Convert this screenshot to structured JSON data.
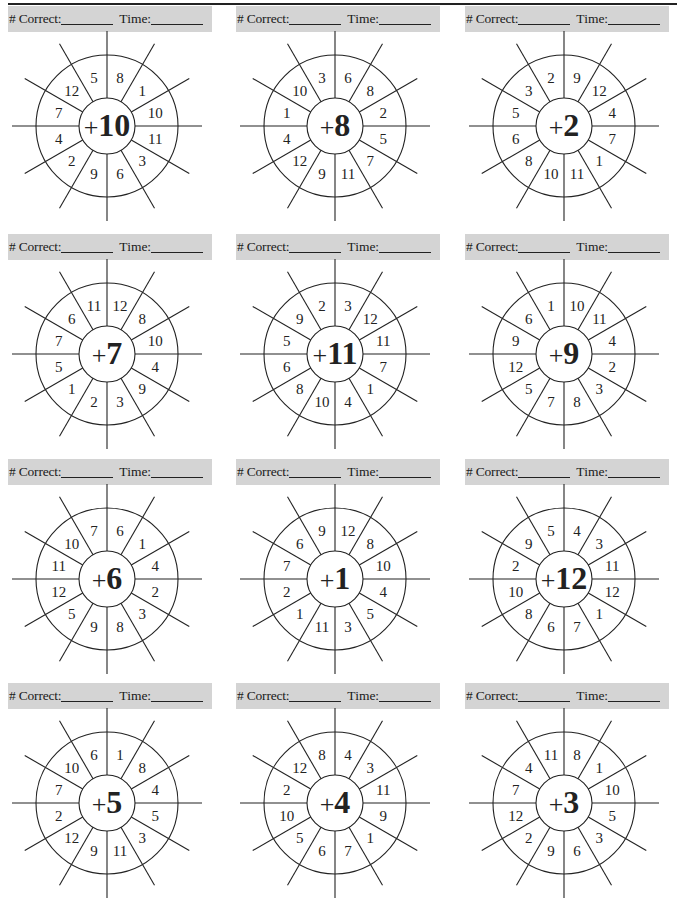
{
  "page": {
    "header_label_correct": "# Correct:",
    "header_label_time": "Time:"
  },
  "wheels": [
    {
      "operator": "+",
      "value": "10",
      "numbers": [
        "8",
        "1",
        "10",
        "11",
        "3",
        "6",
        "9",
        "2",
        "4",
        "7",
        "12",
        "5"
      ]
    },
    {
      "operator": "+",
      "value": "8",
      "numbers": [
        "6",
        "8",
        "2",
        "5",
        "7",
        "11",
        "9",
        "12",
        "4",
        "1",
        "10",
        "3"
      ]
    },
    {
      "operator": "+",
      "value": "2",
      "numbers": [
        "9",
        "12",
        "4",
        "7",
        "1",
        "11",
        "10",
        "8",
        "6",
        "5",
        "3",
        "2"
      ]
    },
    {
      "operator": "+",
      "value": "7",
      "numbers": [
        "12",
        "8",
        "10",
        "4",
        "9",
        "3",
        "2",
        "1",
        "5",
        "7",
        "6",
        "11"
      ]
    },
    {
      "operator": "+",
      "value": "11",
      "numbers": [
        "3",
        "12",
        "11",
        "7",
        "1",
        "4",
        "10",
        "8",
        "6",
        "5",
        "9",
        "2"
      ]
    },
    {
      "operator": "+",
      "value": "9",
      "numbers": [
        "10",
        "11",
        "4",
        "2",
        "3",
        "8",
        "7",
        "5",
        "12",
        "9",
        "6",
        "1"
      ]
    },
    {
      "operator": "+",
      "value": "6",
      "numbers": [
        "6",
        "1",
        "4",
        "2",
        "3",
        "8",
        "9",
        "5",
        "12",
        "11",
        "10",
        "7"
      ]
    },
    {
      "operator": "+",
      "value": "1",
      "numbers": [
        "12",
        "8",
        "10",
        "4",
        "5",
        "3",
        "11",
        "1",
        "2",
        "7",
        "6",
        "9"
      ]
    },
    {
      "operator": "+",
      "value": "12",
      "numbers": [
        "4",
        "3",
        "11",
        "12",
        "1",
        "7",
        "6",
        "8",
        "10",
        "2",
        "9",
        "5"
      ]
    },
    {
      "operator": "+",
      "value": "5",
      "numbers": [
        "1",
        "8",
        "4",
        "5",
        "3",
        "11",
        "9",
        "12",
        "2",
        "7",
        "10",
        "6"
      ]
    },
    {
      "operator": "+",
      "value": "4",
      "numbers": [
        "4",
        "3",
        "11",
        "9",
        "1",
        "7",
        "6",
        "5",
        "10",
        "2",
        "12",
        "8"
      ]
    },
    {
      "operator": "+",
      "value": "3",
      "numbers": [
        "8",
        "1",
        "10",
        "5",
        "3",
        "6",
        "9",
        "2",
        "12",
        "7",
        "4",
        "11"
      ]
    }
  ],
  "colors": {
    "header_bg": "#d4d4d4",
    "ink": "#222222",
    "paper": "#ffffff"
  }
}
